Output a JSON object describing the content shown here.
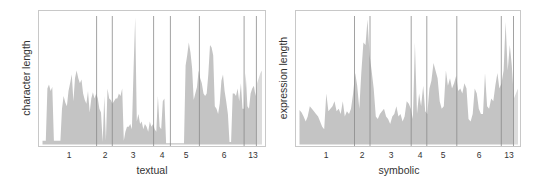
{
  "colors": {
    "area": "#c4c4c4",
    "area_last": "#dcdcdc",
    "divider": "#8a8a8a",
    "frame": "#c8c8c8",
    "text": "#333333"
  },
  "chart_data": [
    {
      "type": "area",
      "title": "",
      "xlabel": "textual",
      "ylabel": "character length",
      "grid": false,
      "legend": null,
      "categories": [
        "1",
        "2",
        "3",
        "4",
        "5",
        "6",
        "13"
      ],
      "segment_boundaries_frac": [
        0.0,
        0.26,
        0.33,
        0.515,
        0.59,
        0.72,
        0.92,
        0.975,
        1.0
      ],
      "y_range": [
        0,
        100
      ],
      "values": [
        3,
        3,
        3,
        44,
        47,
        42,
        45,
        3,
        3,
        3,
        3,
        3,
        28,
        38,
        33,
        30,
        42,
        48,
        55,
        34,
        52,
        58,
        52,
        48,
        51,
        40,
        35,
        32,
        42,
        25,
        36,
        41,
        36,
        40,
        36,
        28,
        25,
        2,
        38,
        3,
        44,
        36,
        35,
        32,
        34,
        36,
        36,
        40,
        38,
        44,
        3,
        10,
        14,
        14,
        16,
        12,
        60,
        100,
        18,
        24,
        16,
        18,
        12,
        16,
        14,
        10,
        18,
        14,
        16,
        12,
        10,
        38,
        14,
        12,
        34,
        36,
        1,
        1,
        1,
        1,
        1,
        1,
        1,
        1,
        1,
        1,
        1,
        1,
        62,
        70,
        80,
        72,
        60,
        35,
        40,
        45,
        58,
        52,
        48,
        40,
        38,
        40,
        55,
        78,
        76,
        70,
        30,
        28,
        24,
        32,
        50,
        55,
        42,
        34,
        24,
        2,
        2,
        40,
        40,
        38,
        44,
        34,
        48,
        28,
        28,
        56,
        30,
        28,
        40,
        44,
        46,
        38,
        48,
        52,
        56,
        58
      ]
    },
    {
      "type": "area",
      "title": "",
      "xlabel": "symbolic",
      "ylabel": "expression length",
      "grid": false,
      "legend": null,
      "categories": [
        "1",
        "2",
        "3",
        "4",
        "5",
        "6",
        "13"
      ],
      "segment_boundaries_frac": [
        0.0,
        0.265,
        0.335,
        0.52,
        0.59,
        0.725,
        0.925,
        0.98,
        1.0
      ],
      "y_range": [
        0,
        100
      ],
      "values": [
        27,
        25,
        22,
        18,
        22,
        30,
        28,
        26,
        24,
        22,
        18,
        14,
        12,
        40,
        26,
        28,
        30,
        34,
        26,
        28,
        24,
        34,
        22,
        26,
        24,
        28,
        40,
        56,
        46,
        28,
        56,
        80,
        78,
        98,
        70,
        58,
        44,
        22,
        20,
        24,
        26,
        28,
        22,
        20,
        16,
        22,
        24,
        30,
        22,
        24,
        18,
        22,
        34,
        32,
        28,
        20,
        80,
        24,
        40,
        30,
        46,
        26,
        24,
        44,
        50,
        64,
        58,
        52,
        34,
        28,
        30,
        58,
        46,
        52,
        44,
        48,
        54,
        42,
        44,
        40,
        48,
        44,
        20,
        18,
        24,
        44,
        40,
        28,
        24,
        24,
        56,
        30,
        28,
        36,
        34,
        46,
        56,
        44,
        48,
        58,
        96,
        58,
        78,
        62,
        36,
        40,
        44
      ]
    }
  ],
  "left": {
    "ylabel": "character length",
    "xlabel": "textual",
    "ticks": [
      {
        "label": "1",
        "x": 69
      },
      {
        "label": "2",
        "x": 105
      },
      {
        "label": "3",
        "x": 133
      },
      {
        "label": "4",
        "x": 162
      },
      {
        "label": "5",
        "x": 186
      },
      {
        "label": "6",
        "x": 224
      },
      {
        "label": "13",
        "x": 253
      }
    ]
  },
  "right": {
    "ylabel": "expression length",
    "xlabel": "symbolic",
    "ticks": [
      {
        "label": "1",
        "x": 56
      },
      {
        "label": "2",
        "x": 92
      },
      {
        "label": "3",
        "x": 121
      },
      {
        "label": "4",
        "x": 150
      },
      {
        "label": "5",
        "x": 173
      },
      {
        "label": "6",
        "x": 209
      },
      {
        "label": "13",
        "x": 239
      }
    ]
  }
}
